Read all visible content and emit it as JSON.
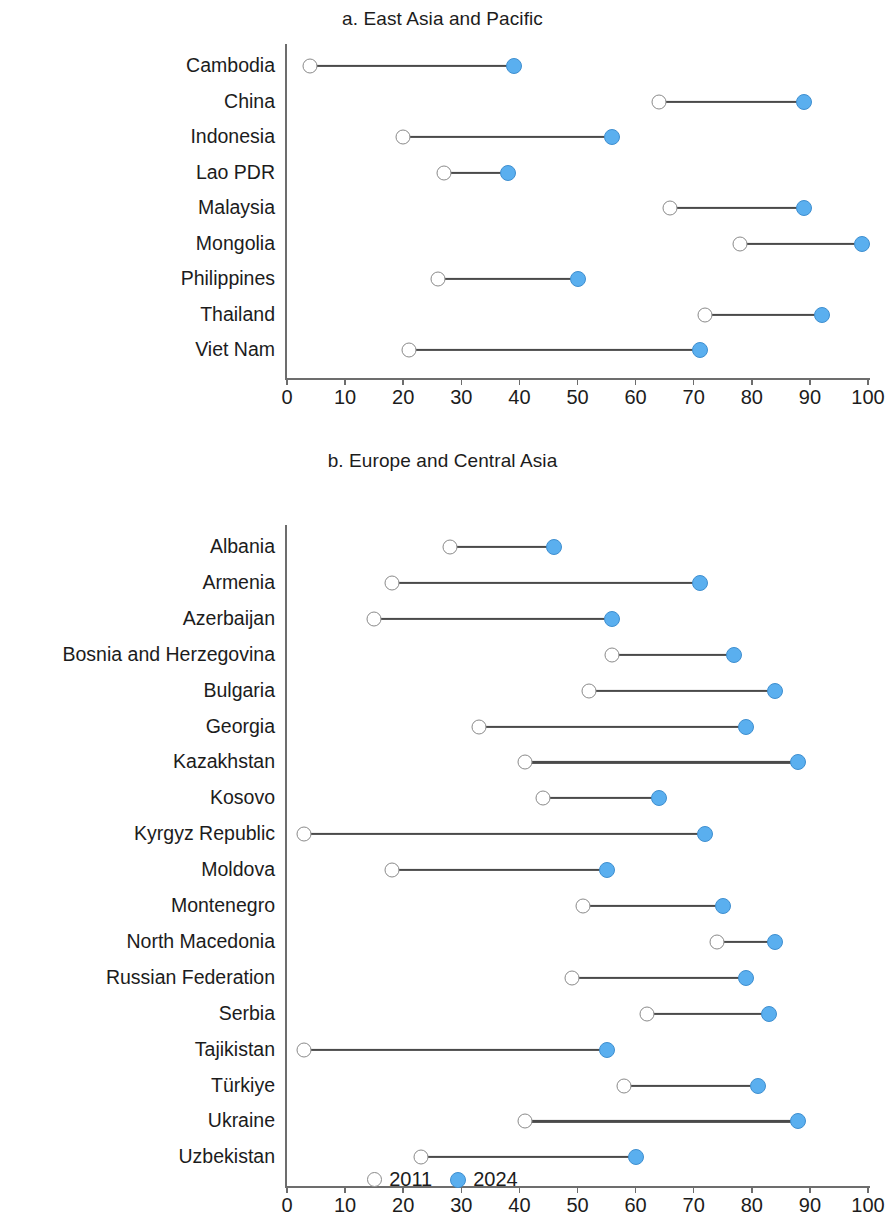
{
  "legend": {
    "items": [
      {
        "label": "2011",
        "style": "open-circle",
        "color": "#ffffff"
      },
      {
        "label": "2024",
        "style": "filled-circle",
        "color": "#5aafef"
      }
    ]
  },
  "colors": {
    "series_2011": "#ffffff",
    "series_2011_stroke": "#8a8a8a",
    "series_2024": "#5aafef",
    "connector": "#4a4a4a",
    "axis": "#6d6d6d",
    "text": "#1c1c1c"
  },
  "panels": [
    {
      "title": "a. East Asia and Pacific",
      "axis": {
        "min": 0,
        "max": 100,
        "ticks": [
          "0",
          "10",
          "20",
          "30",
          "40",
          "50",
          "60",
          "70",
          "80",
          "90",
          "100"
        ]
      }
    },
    {
      "title": "b. Europe and Central Asia",
      "axis": {
        "min": 0,
        "max": 100,
        "ticks": [
          "0",
          "10",
          "20",
          "30",
          "40",
          "50",
          "60",
          "70",
          "80",
          "90",
          "100"
        ]
      }
    }
  ],
  "chart_data": [
    {
      "type": "bar",
      "subtype": "dumbbell",
      "title": "a. East Asia and Pacific",
      "xlabel": "",
      "ylabel": "",
      "xlim": [
        0,
        100
      ],
      "grid": false,
      "legend_position": "bottom",
      "categories": [
        "Cambodia",
        "China",
        "Indonesia",
        "Lao PDR",
        "Malaysia",
        "Mongolia",
        "Philippines",
        "Thailand",
        "Viet Nam"
      ],
      "series": [
        {
          "name": "2011",
          "values": [
            4,
            64,
            20,
            27,
            66,
            78,
            26,
            72,
            21
          ]
        },
        {
          "name": "2024",
          "values": [
            39,
            89,
            56,
            38,
            89,
            99,
            50,
            92,
            71
          ]
        }
      ]
    },
    {
      "type": "bar",
      "subtype": "dumbbell",
      "title": "b. Europe and Central Asia",
      "xlabel": "",
      "ylabel": "",
      "xlim": [
        0,
        100
      ],
      "grid": false,
      "legend_position": "bottom",
      "categories": [
        "Albania",
        "Armenia",
        "Azerbaijan",
        "Bosnia and Herzegovina",
        "Bulgaria",
        "Georgia",
        "Kazakhstan",
        "Kosovo",
        "Kyrgyz Republic",
        "Moldova",
        "Montenegro",
        "North Macedonia",
        "Russian Federation",
        "Serbia",
        "Tajikistan",
        "Türkiye",
        "Ukraine",
        "Uzbekistan"
      ],
      "series": [
        {
          "name": "2011",
          "values": [
            28,
            18,
            15,
            56,
            52,
            33,
            41,
            44,
            3,
            18,
            51,
            74,
            49,
            62,
            3,
            58,
            41,
            23
          ]
        },
        {
          "name": "2024",
          "values": [
            46,
            71,
            56,
            77,
            84,
            79,
            88,
            64,
            72,
            55,
            75,
            84,
            79,
            83,
            55,
            81,
            88,
            60
          ]
        }
      ]
    }
  ]
}
